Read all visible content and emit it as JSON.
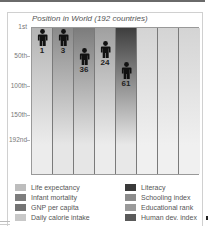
{
  "chart_data": {
    "type": "bar",
    "title": "Position in World (192 countries)",
    "xlabel": "",
    "ylabel": "",
    "y_axis": {
      "inverted": true,
      "range": [
        1,
        192
      ],
      "ticks": [
        {
          "label": "1st",
          "value": 1
        },
        {
          "label": "50th",
          "value": 50
        },
        {
          "label": "100th",
          "value": 100
        },
        {
          "label": "150th",
          "value": 150
        },
        {
          "label": "192nd",
          "value": 192
        }
      ]
    },
    "grid": true,
    "legend_position": "bottom",
    "categories": [
      "Life expectancy",
      "Infant mortality",
      "GNP per capita",
      "Daily calorie intake",
      "Literacy",
      "Schooling index",
      "Educational rank",
      "Human dev. index"
    ],
    "values": [
      1,
      3,
      36,
      24,
      61,
      null,
      null,
      null
    ],
    "colors": [
      "#bdbdbd",
      "#7d7d7d",
      "#747474",
      "#c8c8c8",
      "#3a3a3a",
      "#8c8c8c",
      "#9a9a9a",
      "#5a5a5a"
    ]
  },
  "title": "Position in World (192 countries)",
  "ticks": [
    {
      "label": "1st",
      "y": 27
    },
    {
      "label": "50th",
      "y": 56
    },
    {
      "label": "100th",
      "y": 86
    },
    {
      "label": "150th",
      "y": 115
    },
    {
      "label": "192nd",
      "y": 140
    }
  ],
  "columns": [
    {
      "name": "Life expectancy",
      "top": "#b4b4b4",
      "bottom": "#ececec",
      "value": "1"
    },
    {
      "name": "Infant mortality",
      "top": "#8a8a8a",
      "bottom": "#e6e6e6",
      "value": "3"
    },
    {
      "name": "GNP per capita",
      "top": "#7c7c7c",
      "bottom": "#e6e6e6",
      "value": "36"
    },
    {
      "name": "Daily calorie intake",
      "top": "#a0a0a0",
      "bottom": "#ececec",
      "value": "24"
    },
    {
      "name": "Literacy",
      "top": "#3e3e3e",
      "bottom": "#e8e8e8",
      "value": "61"
    },
    {
      "name": "Schooling index",
      "top": "#d4d4d4",
      "bottom": "#f0f0f0",
      "value": ""
    },
    {
      "name": "Educational rank",
      "top": "#d4d4d4",
      "bottom": "#f0f0f0",
      "value": ""
    },
    {
      "name": "Human dev. index",
      "top": "#d4d4d4",
      "bottom": "#f0f0f0",
      "value": ""
    }
  ],
  "legend": {
    "left": [
      {
        "label": "Life expectancy",
        "color": "#bdbdbd"
      },
      {
        "label": "Infant mortality",
        "color": "#7d7d7d"
      },
      {
        "label": "GNP per capita",
        "color": "#747474"
      },
      {
        "label": "Daily calorie intake",
        "color": "#c8c8c8"
      }
    ],
    "right": [
      {
        "label": "Literacy",
        "color": "#3a3a3a"
      },
      {
        "label": "Schooling index",
        "color": "#8c8c8c"
      },
      {
        "label": "Educational rank",
        "color": "#9a9a9a"
      },
      {
        "label": "Human dev. index",
        "color": "#5a5a5a"
      }
    ]
  }
}
